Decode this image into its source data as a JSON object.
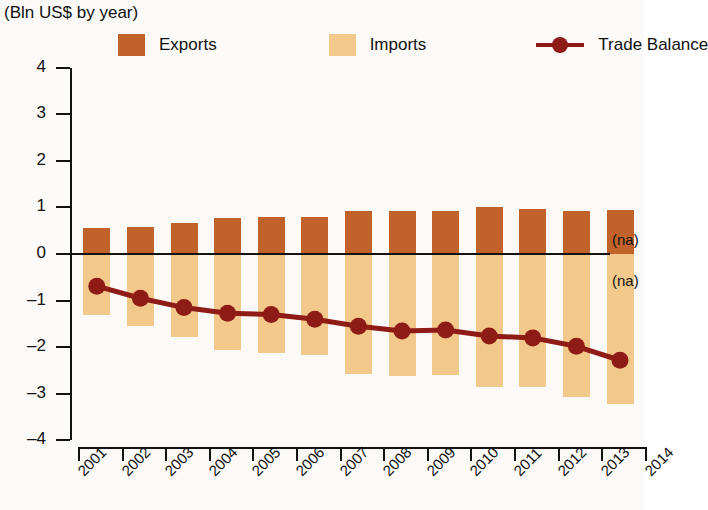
{
  "subtitle": "(Bln US$ by year)",
  "legend": {
    "items": [
      {
        "label": "Exports",
        "color": "#C0622A",
        "marker": "square"
      },
      {
        "label": "Imports",
        "color": "#F3C98B",
        "marker": "square"
      },
      {
        "label": "Trade Balance",
        "color": "#8E1B16",
        "marker": "line-dot"
      }
    ]
  },
  "annotations": [
    {
      "text": "(na)",
      "position": "above-zero-right"
    },
    {
      "text": "(na)",
      "position": "below-zero-right"
    }
  ],
  "chart_data": {
    "type": "bar",
    "title": "(Bln US$ by year)",
    "xlabel": "",
    "ylabel": "Bln US$",
    "ylim": [
      -4,
      4
    ],
    "yticks": [
      4,
      3,
      2,
      1,
      0,
      -1,
      -2,
      -3,
      -4
    ],
    "xticks": [
      "2001",
      "2002",
      "2003",
      "2004",
      "2005",
      "2006",
      "2007",
      "2008",
      "2009",
      "2010",
      "2011",
      "2012",
      "2013",
      "2014"
    ],
    "categories": [
      "2001",
      "2002",
      "2003",
      "2004",
      "2005",
      "2006",
      "2007",
      "2008",
      "2009",
      "2010",
      "2011",
      "2012",
      "2013"
    ],
    "grid": false,
    "legend_position": "top",
    "series": [
      {
        "name": "Exports",
        "type": "bar",
        "color": "#C0622A",
        "values": [
          0.56,
          0.58,
          0.66,
          0.78,
          0.8,
          0.8,
          0.92,
          0.93,
          0.93,
          1.0,
          0.97,
          0.92,
          0.95
        ]
      },
      {
        "name": "Imports",
        "type": "bar",
        "color": "#F3C98B",
        "values": [
          -1.3,
          -1.55,
          -1.78,
          -2.05,
          -2.12,
          -2.17,
          -2.58,
          -2.62,
          -2.6,
          -2.85,
          -2.86,
          -3.07,
          -3.22
        ]
      },
      {
        "name": "Trade Balance",
        "type": "line",
        "color": "#8E1B16",
        "values": [
          -0.69,
          -0.95,
          -1.15,
          -1.27,
          -1.3,
          -1.4,
          -1.55,
          -1.65,
          -1.63,
          -1.76,
          -1.8,
          -1.98,
          -2.28
        ]
      }
    ]
  }
}
